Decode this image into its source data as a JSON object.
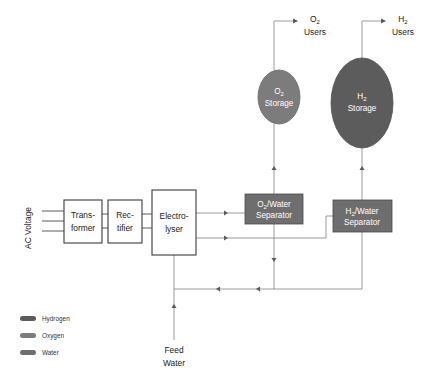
{
  "diagram": {
    "inputs": {
      "ac_voltage_label": "AC Voltage",
      "feed_water_line1": "Feed",
      "feed_water_line2": "Water"
    },
    "process_blocks": [
      {
        "id": "transformer",
        "line1": "Trans-",
        "line2": "former",
        "style": "outline"
      },
      {
        "id": "rectifier",
        "line1": "Rec-",
        "line2": "tifier",
        "style": "outline"
      },
      {
        "id": "electrolyser",
        "line1": "Electro-",
        "line2": "lyser",
        "style": "outline"
      }
    ],
    "separators": [
      {
        "id": "o2-water-separator",
        "line1_pre": "O",
        "line1_sub": "2",
        "line1_post": "/Water",
        "line2": "Separator",
        "fill": "#6e6e6e"
      },
      {
        "id": "h2-water-separator",
        "line1_pre": "H",
        "line1_sub": "2",
        "line1_post": "/Water",
        "line2": "Separator",
        "fill": "#6e6e6e"
      }
    ],
    "storage": [
      {
        "id": "o2-storage",
        "line1_pre": "O",
        "line1_sub": "2",
        "line2": "Storage",
        "fill": "#7c7c7c"
      },
      {
        "id": "h2-storage",
        "line1_pre": "H",
        "line1_sub": "2",
        "line2": "Storage",
        "fill": "#5c5c5c"
      }
    ],
    "outputs": [
      {
        "id": "o2-users",
        "line1_pre": "O",
        "line1_sub": "2",
        "line2": "Users"
      },
      {
        "id": "h2-users",
        "line1_pre": "H",
        "line1_sub": "2",
        "line2": "Users"
      }
    ],
    "legend": {
      "items": [
        {
          "label": "Hydrogen",
          "color": "#5c5c5c"
        },
        {
          "label": "Oxygen",
          "color": "#7c7c7c"
        },
        {
          "label": "Water",
          "color": "#6e6e6e"
        }
      ]
    },
    "colors": {
      "pipe": "#8e8e8e",
      "outline": "#3b3b3b",
      "text": "#222222",
      "text_inverse": "#ffffff"
    }
  }
}
